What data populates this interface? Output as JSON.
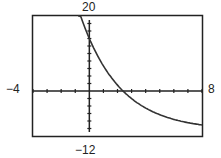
{
  "chart_data": {
    "type": "line",
    "title": "",
    "xlabel": "",
    "ylabel": "",
    "xlim": [
      -4,
      8
    ],
    "ylim": [
      -12,
      20
    ],
    "x_tick_step": 1,
    "y_tick_step": 2,
    "grid": false,
    "window_labels": {
      "xmin": "-4",
      "xmax": "8",
      "ymin": "-12",
      "ymax": "20"
    },
    "series": [
      {
        "name": "exponential decay curve",
        "x": [
          -0.8,
          0,
          1,
          2,
          2.4,
          3,
          4,
          5,
          6,
          7,
          8
        ],
        "y": [
          20,
          14,
          6.7,
          1.6,
          0,
          -1.9,
          -4.5,
          -6.3,
          -7.5,
          -8.4,
          -9.0
        ]
      }
    ]
  },
  "labels": {
    "xmin": "−4",
    "xmax": "8",
    "ymin": "−12",
    "ymax": "20"
  }
}
